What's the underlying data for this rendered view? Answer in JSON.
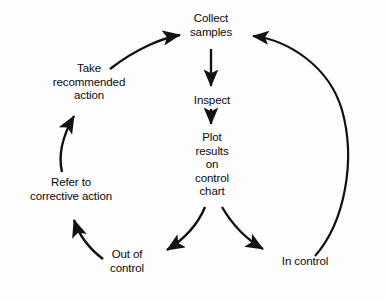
{
  "diagram": {
    "kind": "flowchart",
    "stroke_color": "#111111",
    "background_color": "#fdfdfd",
    "nodes": [
      {
        "id": "collect_samples",
        "label": "Collect\nsamples"
      },
      {
        "id": "inspect",
        "label": "Inspect"
      },
      {
        "id": "plot_results",
        "label": "Plot\nresults\non\ncontrol\nchart"
      },
      {
        "id": "in_control",
        "label": "In control"
      },
      {
        "id": "out_of_control",
        "label": "Out of\ncontrol"
      },
      {
        "id": "refer_corrective",
        "label": "Refer to\ncorrective action"
      },
      {
        "id": "take_recommended",
        "label": "Take\nrecommended\naction"
      }
    ],
    "edges": [
      {
        "from": "collect_samples",
        "to": "inspect",
        "style": "straight",
        "arrow": true
      },
      {
        "from": "inspect",
        "to": "plot_results",
        "style": "straight",
        "arrow": true
      },
      {
        "from": "plot_results",
        "to": "out_of_control",
        "style": "curved",
        "arrow": true
      },
      {
        "from": "plot_results",
        "to": "in_control",
        "style": "curved",
        "arrow": true
      },
      {
        "from": "out_of_control",
        "to": "refer_corrective",
        "style": "curved",
        "arrow": true
      },
      {
        "from": "refer_corrective",
        "to": "take_recommended",
        "style": "curved",
        "arrow": true
      },
      {
        "from": "take_recommended",
        "to": "collect_samples",
        "style": "curved",
        "arrow": true
      },
      {
        "from": "in_control",
        "to": "collect_samples",
        "style": "curved",
        "arrow": true
      }
    ]
  }
}
